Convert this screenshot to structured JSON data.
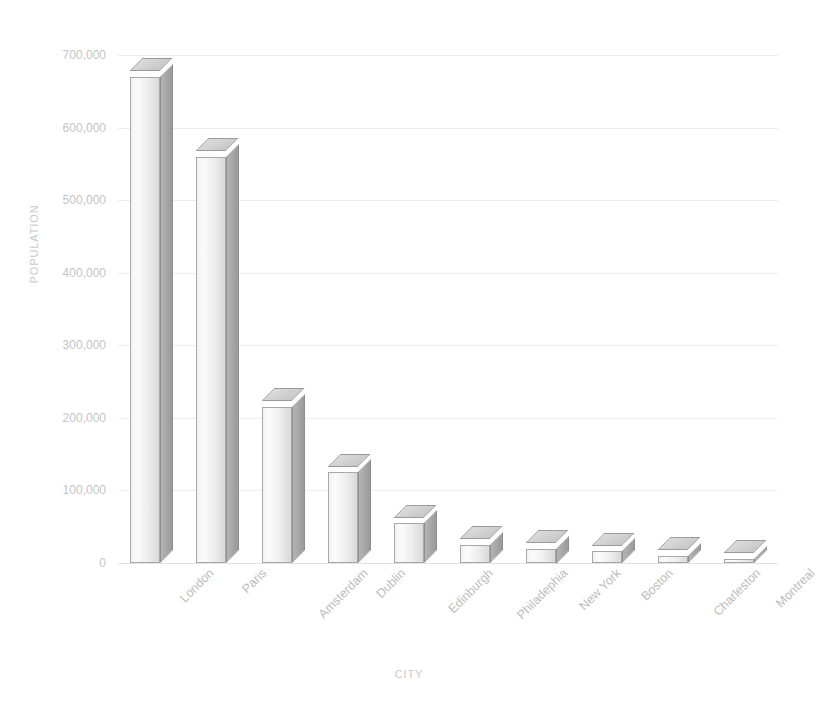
{
  "chart_data": {
    "type": "bar",
    "title": "",
    "xlabel": "CITY",
    "ylabel": "POPULATION",
    "categories": [
      "London",
      "Paris",
      "Amsterdam",
      "Dublin",
      "Edinburgh",
      "Philadephia",
      "New York",
      "Boston",
      "Charleston",
      "Montreal"
    ],
    "values": [
      670000,
      560000,
      215000,
      125000,
      55000,
      25000,
      20000,
      16000,
      10000,
      6000
    ],
    "series": [
      {
        "name": "Population",
        "values": [
          670000,
          560000,
          215000,
          125000,
          55000,
          25000,
          20000,
          16000,
          10000,
          6000
        ]
      }
    ],
    "ylim": [
      0,
      700000
    ],
    "ytick_values": [
      0,
      100000,
      200000,
      300000,
      400000,
      500000,
      600000,
      700000
    ],
    "ytick_labels": [
      "0",
      "100,000",
      "200,000",
      "300,000",
      "400,000",
      "500,000",
      "600,000",
      "700,000"
    ],
    "grid": true,
    "legend": "none",
    "style": "3d-column",
    "colors": {
      "bar_front": "#f0f0f0",
      "bar_side": "#a6a6a6",
      "bar_top": "#d2d2d2",
      "bar_outline": "#a0a0a0",
      "gridline": "#ededed",
      "axis_text": "#c4c4c4",
      "axis_title": "#c9c9c9",
      "background": "#ffffff"
    }
  }
}
